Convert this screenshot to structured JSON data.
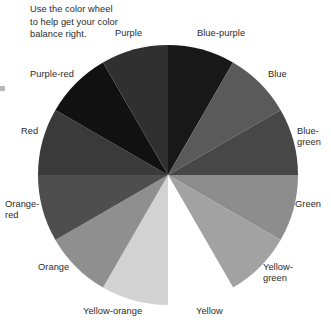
{
  "caption": {
    "text": "Use the color wheel\nto help get your color\nbalance right."
  },
  "wheel": {
    "title": "color-wheel",
    "center": {
      "x": 131,
      "y": 131
    },
    "radius": 130,
    "segment_count": 12,
    "segment_degrees": 30,
    "start_angle_deg": -90,
    "segments": [
      {
        "label": "Blue-purple",
        "color": "#181818",
        "start_deg": -90,
        "end_deg": -60
      },
      {
        "label": "Blue",
        "color": "#5a5a5a",
        "start_deg": -60,
        "end_deg": -30
      },
      {
        "label": "Blue-green",
        "color": "#474747",
        "start_deg": -30,
        "end_deg": 0
      },
      {
        "label": "Green",
        "color": "#8d8d8d",
        "start_deg": 0,
        "end_deg": 30
      },
      {
        "label": "Yellow-green",
        "color": "#a2a2a2",
        "start_deg": 30,
        "end_deg": 60
      },
      {
        "label": "Yellow",
        "color": "#ffffff",
        "start_deg": 60,
        "end_deg": 90
      },
      {
        "label": "Yellow-orange",
        "color": "#d2d2d2",
        "start_deg": 90,
        "end_deg": 120
      },
      {
        "label": "Orange",
        "color": "#8f8f8f",
        "start_deg": 120,
        "end_deg": 150
      },
      {
        "label": "Orange-red",
        "color": "#4e4e4e",
        "start_deg": 150,
        "end_deg": 180
      },
      {
        "label": "Red",
        "color": "#3a3a3a",
        "start_deg": 180,
        "end_deg": 210
      },
      {
        "label": "Purple-red",
        "color": "#111111",
        "start_deg": 210,
        "end_deg": 240
      },
      {
        "label": "Purple",
        "color": "#303030",
        "start_deg": 240,
        "end_deg": 270
      }
    ]
  },
  "labels": {
    "purple": "Purple",
    "blue_purple": "Blue-purple",
    "blue": "Blue",
    "blue_green": "Blue-\ngreen",
    "green": "Green",
    "yellow_green": "Yellow-\ngreen",
    "yellow": "Yellow",
    "yellow_orange": "Yellow-orange",
    "orange": "Orange",
    "orange_red": "Orange-\nred",
    "red": "Red",
    "purple_red": "Purple-red"
  },
  "colors": {
    "background": "#ffffff",
    "text": "#2b2b2b",
    "margin_tick": "#b9b9b9"
  }
}
